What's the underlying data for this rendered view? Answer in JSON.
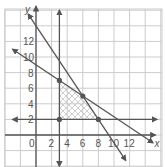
{
  "chart_data": {
    "type": "line",
    "title": "",
    "xlabel": "x",
    "ylabel": "y",
    "xlim": [
      -4,
      16
    ],
    "ylim": [
      -4,
      16
    ],
    "grid": true,
    "grid_step": 2,
    "x_ticks": [
      "0",
      "2",
      "4",
      "6",
      "8",
      "10",
      "12"
    ],
    "y_ticks": [
      "2",
      "4",
      "6",
      "8",
      "10",
      "12"
    ],
    "lines": [
      {
        "name": "x = 3",
        "equation": "x = 3",
        "from": [
          3,
          -4
        ],
        "to": [
          3,
          16
        ]
      },
      {
        "name": "y = 2",
        "equation": "y = 2",
        "from": [
          -3,
          2
        ],
        "to": [
          15.5,
          2
        ]
      },
      {
        "name": "y = -2/3x + 9",
        "equation": "y = -2/3 x + 9",
        "from": [
          -3,
          11
        ],
        "to": [
          15,
          -1
        ]
      },
      {
        "name": "y = -3/2x + 14",
        "equation": "y = -3/2 x + 14",
        "from": [
          -1,
          15.5
        ],
        "to": [
          11.5,
          -3.25
        ]
      }
    ],
    "points": [
      [
        3,
        2
      ],
      [
        3,
        7
      ],
      [
        6,
        5
      ],
      [
        8,
        2
      ]
    ],
    "shaded_region": {
      "vertices": [
        [
          3,
          2
        ],
        [
          3,
          7
        ],
        [
          6,
          5
        ],
        [
          8,
          2
        ]
      ],
      "pattern": "crosshatch"
    }
  },
  "axes": {
    "x_label": "x",
    "y_label": "y"
  },
  "colors": {
    "line": "#555555",
    "grid": "#cccccc",
    "hatch": "#bbbbbb",
    "point": "#555555",
    "text": "#555555"
  }
}
